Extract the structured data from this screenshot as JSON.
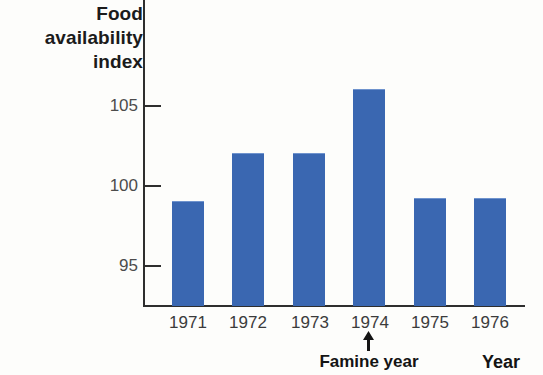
{
  "chart_data": {
    "type": "bar",
    "title": "",
    "ylabel": "Food availability index",
    "ylabel_lines": [
      "Food",
      "availability",
      "index"
    ],
    "xlabel": "Year",
    "categories": [
      "1971",
      "1972",
      "1973",
      "1974",
      "1975",
      "1976"
    ],
    "values": [
      99,
      102,
      102,
      106,
      99.2,
      99.2
    ],
    "ylim": [
      93,
      108.5
    ],
    "yticks": [
      95,
      100,
      105
    ],
    "ytick_labels": [
      "95",
      "100",
      "105"
    ],
    "grid": false,
    "legend": null,
    "bar_color": "#3a67b1",
    "axis_color": "#2e2e2e",
    "annotations": [
      {
        "label": "Famine year",
        "target_category": "1974",
        "marker": "up-arrow"
      }
    ]
  },
  "axis": {
    "y_title_lines": [
      "Food",
      "availability",
      "index"
    ],
    "y_tick_labels": [
      "105",
      "100",
      "95"
    ],
    "x_tick_labels": [
      "1971",
      "1972",
      "1973",
      "1974",
      "1975",
      "1976"
    ],
    "x_axis_title": "Year"
  },
  "annotation": {
    "famine_label": "Famine year",
    "arrow_icon": "up-arrow-icon"
  }
}
